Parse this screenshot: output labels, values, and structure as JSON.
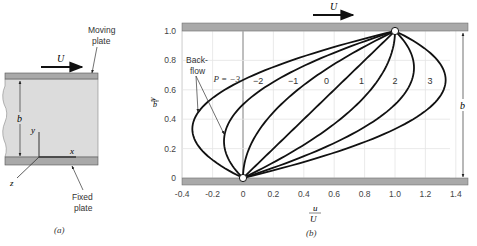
{
  "panel_a": {
    "caption": "(a)",
    "moving_plate_label": [
      "Moving",
      "plate"
    ],
    "fixed_plate_label": [
      "Fixed",
      "plate"
    ],
    "velocity_label": "U",
    "gap_label": "b",
    "axis_labels": {
      "x": "x",
      "y": "y",
      "z": "z"
    },
    "colors": {
      "fluid": "#dcdcdc",
      "plate": "#a9a9a9",
      "plate_edge": "#555555"
    }
  },
  "panel_b": {
    "caption": "(b)",
    "velocity_label": "U",
    "gap_label": "b",
    "backflow_label": [
      "Back-",
      "flow"
    ],
    "p_prefix": "P = ",
    "ylabel_num": "y",
    "ylabel_den": "b",
    "xlabel_num": "u",
    "xlabel_den": "U",
    "colors": {
      "plate": "#a9a9a9",
      "grid": "#e4e4e4",
      "curve": "#111111",
      "axis": "#888888"
    }
  },
  "chart_data": {
    "type": "line",
    "title": "",
    "xlabel": "u/U",
    "ylabel": "y/b",
    "xlim": [
      -0.4,
      1.45
    ],
    "ylim": [
      0,
      1.0
    ],
    "x_ticks": [
      "-0.4",
      "-0.2",
      "0",
      "0.2",
      "0.4",
      "0.6",
      "0.8",
      "1.0",
      "1.2",
      "1.4"
    ],
    "y_ticks": [
      "0",
      "0.2",
      "0.4",
      "0.6",
      "0.8",
      "1.0"
    ],
    "grid": true,
    "equation": "u/U = y/b + P (y/b)(1 - y/b)",
    "series": [
      {
        "name": "P = -3",
        "P": -3,
        "label": "P = −3",
        "label_pos": [
          -0.02,
          0.65
        ]
      },
      {
        "name": "P = -2",
        "P": -2,
        "label": "−2",
        "label_pos": [
          0.1,
          0.64
        ]
      },
      {
        "name": "P = -1",
        "P": -1,
        "label": "−1",
        "label_pos": [
          0.33,
          0.64
        ]
      },
      {
        "name": "P = 0",
        "P": 0,
        "label": "0",
        "label_pos": [
          0.55,
          0.64
        ]
      },
      {
        "name": "P = 1",
        "P": 1,
        "label": "1",
        "label_pos": [
          0.78,
          0.64
        ]
      },
      {
        "name": "P = 2",
        "P": 2,
        "label": "2",
        "label_pos": [
          1.0,
          0.64
        ]
      },
      {
        "name": "P = 3",
        "P": 3,
        "label": "3",
        "label_pos": [
          1.23,
          0.64
        ]
      }
    ],
    "annotations": [
      {
        "text": "Back-flow",
        "points_to": [
          "P = -3",
          "P = -2"
        ]
      }
    ]
  }
}
